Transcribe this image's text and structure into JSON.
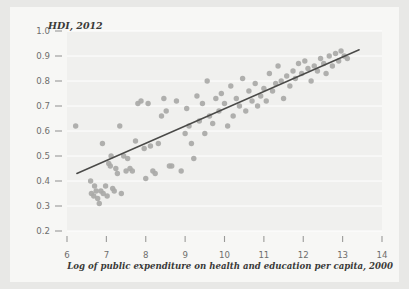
{
  "figure": {
    "background_color": "#e8e8e6",
    "panel_color": "#f7f7f5",
    "plot_background_color": "#f0f0ee",
    "gridline_color": "#ffffff",
    "point_color": "#a9a9a7",
    "trendline_color": "#4a4a48",
    "tick_label_color": "#6e6e6c"
  },
  "chart_data": {
    "type": "scatter",
    "title": "",
    "ylabel": "HDI, 2012",
    "xlabel": "Log of public expenditure on health and education per capita, 2000",
    "xlim": [
      6,
      14
    ],
    "ylim": [
      0.2,
      1.0
    ],
    "xticks": [
      6,
      7,
      8,
      9,
      10,
      11,
      12,
      13,
      14
    ],
    "xtick_labels": [
      "6",
      "7",
      "8",
      "9",
      "10",
      "11",
      "12",
      "13",
      "14"
    ],
    "yticks": [
      0.2,
      0.3,
      0.4,
      0.5,
      0.6,
      0.7,
      0.8,
      0.9,
      1.0
    ],
    "ytick_labels": [
      "0.2",
      "0.3",
      "0.4",
      "0.5",
      "0.6",
      "0.7",
      "0.8",
      "0.9",
      "1.0"
    ],
    "grid": "horizontal",
    "legend": "none",
    "trendline": {
      "type": "linear",
      "x_start": 6.25,
      "y_start": 0.43,
      "x_end": 13.42,
      "y_end": 0.925
    },
    "points": [
      [
        6.22,
        0.62
      ],
      [
        6.6,
        0.4
      ],
      [
        6.62,
        0.35
      ],
      [
        6.68,
        0.34
      ],
      [
        6.7,
        0.38
      ],
      [
        6.74,
        0.36
      ],
      [
        6.78,
        0.33
      ],
      [
        6.82,
        0.31
      ],
      [
        6.86,
        0.36
      ],
      [
        6.9,
        0.55
      ],
      [
        6.92,
        0.35
      ],
      [
        6.98,
        0.38
      ],
      [
        7.02,
        0.34
      ],
      [
        7.06,
        0.47
      ],
      [
        7.1,
        0.46
      ],
      [
        7.12,
        0.5
      ],
      [
        7.16,
        0.37
      ],
      [
        7.2,
        0.36
      ],
      [
        7.24,
        0.45
      ],
      [
        7.28,
        0.43
      ],
      [
        7.34,
        0.62
      ],
      [
        7.38,
        0.35
      ],
      [
        7.44,
        0.5
      ],
      [
        7.5,
        0.44
      ],
      [
        7.54,
        0.49
      ],
      [
        7.6,
        0.45
      ],
      [
        7.66,
        0.44
      ],
      [
        7.74,
        0.56
      ],
      [
        7.8,
        0.71
      ],
      [
        7.88,
        0.72
      ],
      [
        7.96,
        0.53
      ],
      [
        8.0,
        0.41
      ],
      [
        8.06,
        0.71
      ],
      [
        8.12,
        0.54
      ],
      [
        8.18,
        0.44
      ],
      [
        8.24,
        0.43
      ],
      [
        8.32,
        0.55
      ],
      [
        8.4,
        0.66
      ],
      [
        8.46,
        0.73
      ],
      [
        8.52,
        0.68
      ],
      [
        8.6,
        0.46
      ],
      [
        8.66,
        0.46
      ],
      [
        8.78,
        0.72
      ],
      [
        8.9,
        0.44
      ],
      [
        9.0,
        0.59
      ],
      [
        9.04,
        0.69
      ],
      [
        9.1,
        0.62
      ],
      [
        9.16,
        0.55
      ],
      [
        9.22,
        0.49
      ],
      [
        9.3,
        0.74
      ],
      [
        9.36,
        0.64
      ],
      [
        9.44,
        0.71
      ],
      [
        9.5,
        0.59
      ],
      [
        9.56,
        0.8
      ],
      [
        9.62,
        0.66
      ],
      [
        9.7,
        0.63
      ],
      [
        9.78,
        0.73
      ],
      [
        9.86,
        0.68
      ],
      [
        9.92,
        0.75
      ],
      [
        10.0,
        0.71
      ],
      [
        10.08,
        0.62
      ],
      [
        10.16,
        0.78
      ],
      [
        10.22,
        0.66
      ],
      [
        10.3,
        0.73
      ],
      [
        10.38,
        0.7
      ],
      [
        10.46,
        0.81
      ],
      [
        10.54,
        0.68
      ],
      [
        10.62,
        0.76
      ],
      [
        10.7,
        0.72
      ],
      [
        10.78,
        0.79
      ],
      [
        10.84,
        0.7
      ],
      [
        10.92,
        0.74
      ],
      [
        11.0,
        0.77
      ],
      [
        11.06,
        0.72
      ],
      [
        11.14,
        0.83
      ],
      [
        11.22,
        0.76
      ],
      [
        11.3,
        0.79
      ],
      [
        11.36,
        0.86
      ],
      [
        11.44,
        0.8
      ],
      [
        11.5,
        0.73
      ],
      [
        11.58,
        0.82
      ],
      [
        11.66,
        0.78
      ],
      [
        11.74,
        0.84
      ],
      [
        11.8,
        0.81
      ],
      [
        11.88,
        0.87
      ],
      [
        11.96,
        0.83
      ],
      [
        12.04,
        0.88
      ],
      [
        12.12,
        0.85
      ],
      [
        12.2,
        0.8
      ],
      [
        12.28,
        0.86
      ],
      [
        12.36,
        0.84
      ],
      [
        12.44,
        0.89
      ],
      [
        12.52,
        0.87
      ],
      [
        12.58,
        0.83
      ],
      [
        12.66,
        0.9
      ],
      [
        12.74,
        0.86
      ],
      [
        12.82,
        0.91
      ],
      [
        12.9,
        0.88
      ],
      [
        12.96,
        0.92
      ],
      [
        13.04,
        0.9
      ],
      [
        13.12,
        0.89
      ]
    ]
  }
}
